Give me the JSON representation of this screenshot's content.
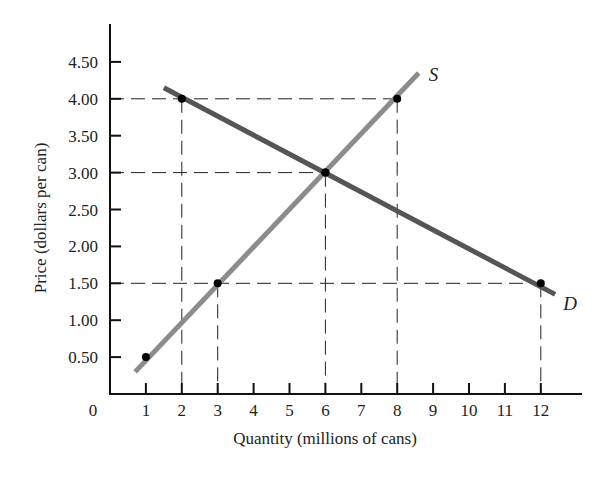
{
  "chart_data": {
    "type": "line",
    "title": "",
    "xlabel": "Quantity (millions of cans)",
    "ylabel": "Price (dollars per can)",
    "xlim": [
      0,
      13
    ],
    "ylim": [
      0,
      4.75
    ],
    "grid": false,
    "legend": "inline labels at line ends",
    "x_ticks": [
      1,
      2,
      3,
      4,
      5,
      6,
      7,
      8,
      9,
      10,
      11,
      12
    ],
    "x_tick_labels": [
      "1",
      "2",
      "3",
      "4",
      "5",
      "6",
      "7",
      "8",
      "9",
      "10",
      "11",
      "12"
    ],
    "origin_label": "0",
    "y_ticks": [
      0.5,
      1.0,
      1.5,
      2.0,
      2.5,
      3.0,
      3.5,
      4.0,
      4.5
    ],
    "y_tick_labels": [
      "0.50",
      "1.00",
      "1.50",
      "2.00",
      "2.50",
      "3.00",
      "3.50",
      "4.00",
      "4.50"
    ],
    "series": [
      {
        "name": "S",
        "label": "S",
        "role": "supply",
        "color": "#8c8c8c",
        "line": {
          "x": [
            0.7,
            8.6
          ],
          "y": [
            0.3,
            4.35
          ]
        },
        "points": [
          {
            "x": 1,
            "y": 0.5
          },
          {
            "x": 3,
            "y": 1.5
          },
          {
            "x": 6,
            "y": 3.0
          },
          {
            "x": 8,
            "y": 4.0
          }
        ]
      },
      {
        "name": "D",
        "label": "D",
        "role": "demand",
        "color": "#555555",
        "line": {
          "x": [
            1.5,
            12.4
          ],
          "y": [
            4.15,
            1.35
          ]
        },
        "points": [
          {
            "x": 2,
            "y": 4.0
          },
          {
            "x": 6,
            "y": 3.0
          },
          {
            "x": 12,
            "y": 1.5
          }
        ]
      }
    ],
    "reference_lines": [
      {
        "type": "dashed",
        "price": 4.0,
        "from_x": 0,
        "to_x": 8,
        "drops": [
          2,
          8
        ]
      },
      {
        "type": "dashed",
        "price": 3.0,
        "from_x": 0,
        "to_x": 6,
        "drops": [
          6
        ]
      },
      {
        "type": "dashed",
        "price": 1.5,
        "from_x": 0,
        "to_x": 12,
        "drops": [
          3,
          12
        ]
      }
    ],
    "equilibrium": {
      "quantity": 6,
      "price": 3.0
    }
  }
}
